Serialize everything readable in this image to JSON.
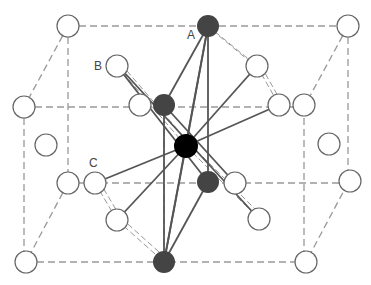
{
  "diagram": {
    "type": "crystal-structure",
    "labels": [
      {
        "text": "A",
        "x": 187,
        "y": 29
      },
      {
        "text": "B",
        "x": 94,
        "y": 60
      },
      {
        "text": "C",
        "x": 89,
        "y": 157
      }
    ],
    "colors": {
      "cell_edge": "#999999",
      "bond": "#555555",
      "open_atom_stroke": "#666666",
      "dark_atom": "#444444",
      "center_atom": "#000000"
    },
    "atom_radius": 11
  }
}
